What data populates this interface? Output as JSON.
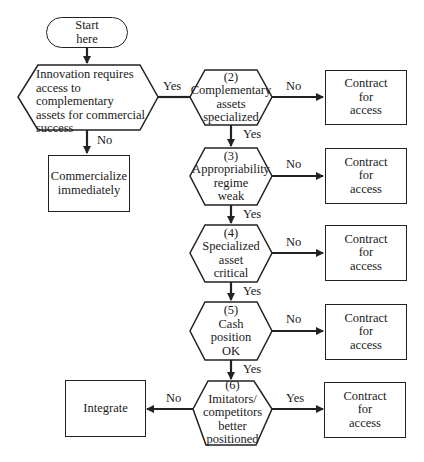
{
  "diagram": {
    "type": "flowchart",
    "start": {
      "label": "Start here"
    },
    "decisions": [
      {
        "id": "1",
        "label": "Innovation requires access to complementary assets for commercial success"
      },
      {
        "id": "2",
        "number": "(2)",
        "label": "Complementary assets specialized"
      },
      {
        "id": "3",
        "number": "(3)",
        "label": "Appropriability regime weak"
      },
      {
        "id": "4",
        "number": "(4)",
        "label": "Specialized asset critical"
      },
      {
        "id": "5",
        "number": "(5)",
        "label": "Cash position OK"
      },
      {
        "id": "6",
        "number": "(6)",
        "label": "Imitators/ competitors better positioned"
      }
    ],
    "outcomes": {
      "commercialize": "Commercialize immediately",
      "integrate": "Integrate",
      "contract": "Contract for access"
    },
    "edge_labels": {
      "yes": "Yes",
      "no": "No"
    },
    "text": {
      "start_l1": "Start",
      "start_l2": "here",
      "d1_l1": "Innovation requires",
      "d1_l2": "access to complementary",
      "d1_l3": "assets for commercial",
      "d1_l4": "success",
      "d2_l1": "(2)",
      "d2_l2": "Complementary",
      "d2_l3": "assets",
      "d2_l4": "specialized",
      "d3_l1": "(3)",
      "d3_l2": "Appropriability",
      "d3_l3": "regime",
      "d3_l4": "weak",
      "d4_l1": "(4)",
      "d4_l2": "Specialized",
      "d4_l3": "asset",
      "d4_l4": "critical",
      "d5_l1": "(5)",
      "d5_l2": "Cash",
      "d5_l3": "position",
      "d5_l4": "OK",
      "d6_l1": "(6)",
      "d6_l2": "Imitators/",
      "d6_l3": "competitors",
      "d6_l4": "better",
      "d6_l5": "positioned",
      "commercialize_l1": "Commercialize",
      "commercialize_l2": "immediately",
      "integrate": "Integrate",
      "contract_l1": "Contract",
      "contract_l2": "for",
      "contract_l3": "access"
    }
  }
}
